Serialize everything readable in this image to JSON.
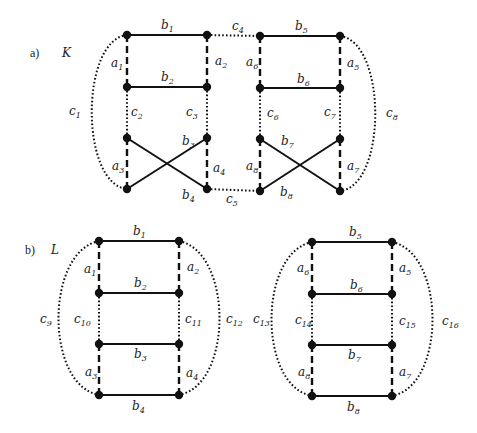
{
  "figure": {
    "panels": [
      {
        "id": "a",
        "part_label": "a)",
        "graph_name": "K",
        "edge_labels": {
          "b1": [
            "b",
            "1"
          ],
          "b2": [
            "b",
            "2"
          ],
          "b3": [
            "b",
            "3"
          ],
          "b4": [
            "b",
            "4"
          ],
          "b5": [
            "b",
            "5"
          ],
          "b6": [
            "b",
            "6"
          ],
          "b7": [
            "b",
            "7"
          ],
          "b8": [
            "b",
            "8"
          ],
          "a1": [
            "a",
            "1"
          ],
          "a2": [
            "a",
            "2"
          ],
          "a3": [
            "a",
            "3"
          ],
          "a4": [
            "a",
            "4"
          ],
          "a5": [
            "a",
            "5"
          ],
          "a6": [
            "a",
            "6"
          ],
          "a7": [
            "a",
            "7"
          ],
          "a8": [
            "a",
            "8"
          ],
          "c1": [
            "c",
            "1"
          ],
          "c2": [
            "c",
            "2"
          ],
          "c3": [
            "c",
            "3"
          ],
          "c4": [
            "c",
            "4"
          ],
          "c5": [
            "c",
            "5"
          ],
          "c6": [
            "c",
            "6"
          ],
          "c7": [
            "c",
            "7"
          ],
          "c8": [
            "c",
            "8"
          ]
        }
      },
      {
        "id": "b",
        "part_label": "b)",
        "graph_name": "L",
        "edge_labels": {
          "b1": [
            "b",
            "1"
          ],
          "b2": [
            "b",
            "2"
          ],
          "b3": [
            "b",
            "3"
          ],
          "b4": [
            "b",
            "4"
          ],
          "b5": [
            "b",
            "5"
          ],
          "b6": [
            "b",
            "6"
          ],
          "b7": [
            "b",
            "7"
          ],
          "b8": [
            "b",
            "8"
          ],
          "a1": [
            "a",
            "1"
          ],
          "a2": [
            "a",
            "2"
          ],
          "a3": [
            "a",
            "3"
          ],
          "a4": [
            "a",
            "4"
          ],
          "a5": [
            "a",
            "5"
          ],
          "a6": [
            "a",
            "6"
          ],
          "a7": [
            "a",
            "7"
          ],
          "a8": [
            "a",
            "8"
          ],
          "c9": [
            "c",
            "9"
          ],
          "c10": [
            "c",
            "10"
          ],
          "c11": [
            "c",
            "11"
          ],
          "c12": [
            "c",
            "12"
          ],
          "c13": [
            "c",
            "13"
          ],
          "c14": [
            "c",
            "14"
          ],
          "c15": [
            "c",
            "15"
          ],
          "c16": [
            "c",
            "16"
          ]
        }
      }
    ],
    "legend_edge_styles": {
      "b": "solid",
      "a": "dashed",
      "c": "dotted"
    }
  }
}
